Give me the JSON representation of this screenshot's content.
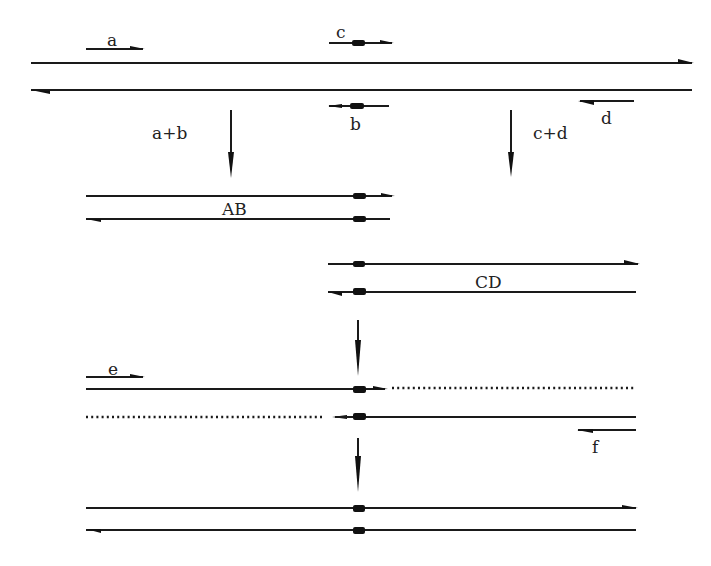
{
  "diagram": {
    "type": "double-strand recombination schematic",
    "ink_color": "#1a1a1a",
    "background": "#ffffff",
    "top_duplex": {
      "strand_labels": {
        "a": "a",
        "b": "b",
        "c": "c",
        "d": "d"
      },
      "merge_labels": {
        "left": "a+b",
        "right": "c+d"
      }
    },
    "intermediate_1": {
      "label": "AB"
    },
    "intermediate_2": {
      "label": "CD"
    },
    "recombinant": {
      "strand_labels": {
        "e": "e",
        "f": "f"
      }
    }
  }
}
